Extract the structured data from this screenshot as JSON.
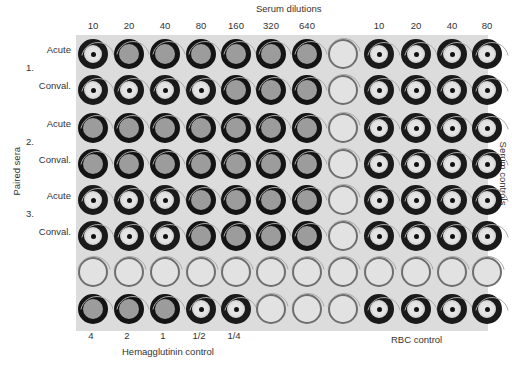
{
  "header": {
    "title": "Serum dilutions"
  },
  "columns": {
    "dilutions": [
      "10",
      "20",
      "40",
      "80",
      "160",
      "320",
      "640",
      "",
      "10",
      "20",
      "40",
      "80"
    ]
  },
  "rows": [
    {
      "group": "1.",
      "label": "Acute",
      "wells": [
        "button",
        "mat",
        "mat",
        "mat",
        "mat",
        "mat",
        "mat",
        "empty",
        "button",
        "button",
        "button",
        "button"
      ]
    },
    {
      "group": "",
      "label": "Conval.",
      "wells": [
        "button",
        "button",
        "button",
        "button",
        "mat",
        "mat",
        "mat",
        "empty",
        "button",
        "button",
        "button",
        "button"
      ]
    },
    {
      "group": "2.",
      "label": "Acute",
      "wells": [
        "mat",
        "mat",
        "mat",
        "mat",
        "mat",
        "mat",
        "mat",
        "empty",
        "button",
        "button",
        "button",
        "button"
      ]
    },
    {
      "group": "",
      "label": "Conval.",
      "wells": [
        "mat",
        "mat",
        "mat",
        "mat",
        "mat",
        "mat",
        "mat",
        "empty",
        "button",
        "button",
        "button",
        "button"
      ]
    },
    {
      "group": "3.",
      "label": "Acute",
      "wells": [
        "button",
        "button",
        "button",
        "mat",
        "mat",
        "mat",
        "mat",
        "empty",
        "button",
        "button",
        "button",
        "button"
      ]
    },
    {
      "group": "",
      "label": "Conval.",
      "wells": [
        "button",
        "button",
        "button",
        "mat",
        "mat",
        "mat",
        "mat",
        "empty",
        "button",
        "button",
        "button",
        "button"
      ]
    },
    {
      "group": "",
      "label": "",
      "wells": [
        "empty",
        "empty",
        "empty",
        "empty",
        "empty",
        "empty",
        "empty",
        "empty",
        "empty",
        "empty",
        "empty",
        "empty"
      ]
    },
    {
      "group": "",
      "label": "",
      "wells": [
        "mat",
        "mat",
        "mat",
        "button",
        "button",
        "empty",
        "empty",
        "empty",
        "button",
        "button",
        "button",
        "button"
      ]
    }
  ],
  "side_labels": {
    "left": "Paired sera",
    "right": "Serum controls"
  },
  "footer": {
    "hemagglutinin_values": [
      "4",
      "2",
      "1",
      "1/2",
      "1/4"
    ],
    "hemagglutinin_title": "Hemagglutinin control",
    "rbc_title": "RBC control"
  },
  "legend": {
    "button": "RBC button (no hemagglutination)",
    "mat": "RBC mat (hemagglutination)",
    "empty": "Empty well"
  }
}
